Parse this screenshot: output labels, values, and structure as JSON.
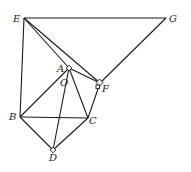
{
  "diagram": {
    "title": "",
    "points": [
      {
        "id": "E",
        "label": "E"
      },
      {
        "id": "G",
        "label": "G"
      },
      {
        "id": "A",
        "label": "A"
      },
      {
        "id": "O",
        "label": "O"
      },
      {
        "id": "F",
        "label": "F"
      },
      {
        "id": "B",
        "label": "B"
      },
      {
        "id": "C",
        "label": "C"
      },
      {
        "id": "D",
        "label": "D"
      }
    ],
    "segments": [
      [
        "E",
        "G"
      ],
      [
        "G",
        "F"
      ],
      [
        "E",
        "F"
      ],
      [
        "E",
        "A"
      ],
      [
        "E",
        "B"
      ],
      [
        "A",
        "B"
      ],
      [
        "A",
        "C"
      ],
      [
        "A",
        "D"
      ],
      [
        "B",
        "C"
      ],
      [
        "B",
        "D"
      ],
      [
        "C",
        "D"
      ],
      [
        "C",
        "F"
      ],
      [
        "A",
        "F"
      ]
    ],
    "right_angle_marks": [
      "A",
      "F",
      "D"
    ]
  }
}
